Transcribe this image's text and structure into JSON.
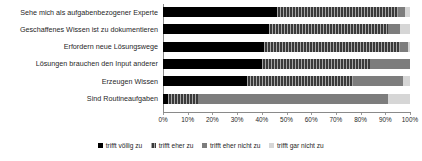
{
  "chart_data": {
    "type": "bar",
    "subtype": "stacked-horizontal-100-percent",
    "title": "",
    "xlabel": "",
    "ylabel": "",
    "xlim": [
      0,
      100
    ],
    "grid": false,
    "legend_position": "bottom",
    "tick_labels": [
      "0%",
      "10%",
      "20%",
      "30%",
      "40%",
      "50%",
      "60%",
      "70%",
      "80%",
      "90%",
      "100%"
    ],
    "tick_values": [
      0,
      10,
      20,
      30,
      40,
      50,
      60,
      70,
      80,
      90,
      100
    ],
    "categories": [
      "Sehe mich als aufgabenbezogener Experte",
      "Geschaffenes Wissen ist zu dokumentieren",
      "Erfordern neue Lösungswege",
      "Lösungen brauchen den Input anderer",
      "Erzeugen Wissen",
      "Sind Routineaufgaben"
    ],
    "series": [
      {
        "name": "trifft völlig zu",
        "color": "#000000",
        "values": [
          46,
          43,
          41,
          40,
          34,
          2
        ]
      },
      {
        "name": "trifft eher zu",
        "color": "#3a3a3a",
        "values": [
          49,
          48,
          55,
          44,
          43,
          12
        ]
      },
      {
        "name": "trifft eher nicht zu",
        "color": "#7d7d7d",
        "values": [
          3,
          5,
          3,
          16,
          20,
          77
        ]
      },
      {
        "name": "trifft gar nicht zu",
        "color": "#d6d6d6",
        "values": [
          2,
          4,
          1,
          0,
          3,
          9
        ]
      }
    ]
  },
  "legend": {
    "items": [
      {
        "label": "trifft völlig zu"
      },
      {
        "label": "trifft eher zu"
      },
      {
        "label": "trifft eher nicht zu"
      },
      {
        "label": "trifft gar nicht zu"
      }
    ]
  }
}
